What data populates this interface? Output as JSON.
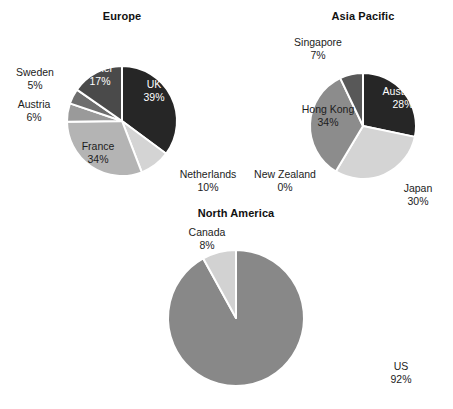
{
  "figure": {
    "background": "#ffffff",
    "separator_color": "#ffffff"
  },
  "chart_data": [
    {
      "type": "pie",
      "title": "Europe",
      "center": [
        122,
        121
      ],
      "radius": 55,
      "start_angle": 0,
      "direction": "clockwise",
      "labels": [
        "UK",
        "Netherlands",
        "France",
        "Austria",
        "Sweden",
        "Other"
      ],
      "values": [
        39,
        10,
        34,
        6,
        5,
        17
      ],
      "value_suffix": "%",
      "colors": [
        "#262626",
        "#d4d4d4",
        "#b4b4b4",
        "#9a9a9a",
        "#6e6e6e",
        "#4a4a4a"
      ],
      "label_text_colors": [
        "#ffffff",
        "#1c1c1c",
        "#1c1c1c",
        "#1c1c1c",
        "#1c1c1c",
        "#ffffff"
      ],
      "slice_label_texts": [
        {
          "name": "UK",
          "value": "39%"
        },
        {
          "name": "Netherlands",
          "value": "10%"
        },
        {
          "name": "France",
          "value": "34%"
        },
        {
          "name": "Austria",
          "value": "6%"
        },
        {
          "name": "Sweden",
          "value": "5%"
        },
        {
          "name": "Other",
          "value": "17%"
        }
      ]
    },
    {
      "type": "pie",
      "title": "Asia Pacific",
      "center": [
        363,
        126
      ],
      "radius": 53,
      "start_angle": 0,
      "direction": "clockwise",
      "labels": [
        "Australia",
        "Japan",
        "New Zealand",
        "Hong Kong",
        "Singapore"
      ],
      "values": [
        28,
        30,
        0,
        34,
        7
      ],
      "value_suffix": "%",
      "colors": [
        "#262626",
        "#d4d4d4",
        "#b0b0b0",
        "#8c8c8c",
        "#585858"
      ],
      "label_text_colors": [
        "#ffffff",
        "#1c1c1c",
        "#1c1c1c",
        "#1c1c1c",
        "#1c1c1c"
      ],
      "slice_label_texts": [
        {
          "name": "Australia",
          "value": "28%"
        },
        {
          "name": "Japan",
          "value": "30%"
        },
        {
          "name": "New Zealand",
          "value": "0%"
        },
        {
          "name": "Hong Kong",
          "value": "34%"
        },
        {
          "name": "Singapore",
          "value": "7%"
        }
      ]
    },
    {
      "type": "pie",
      "title": "North America",
      "center": [
        236,
        318
      ],
      "radius": 68,
      "start_angle": 0,
      "direction": "clockwise",
      "labels": [
        "US",
        "Canada"
      ],
      "values": [
        92,
        8
      ],
      "value_suffix": "%",
      "colors": [
        "#888888",
        "#d2d2d2"
      ],
      "label_text_colors": [
        "#1c1c1c",
        "#1c1c1c"
      ],
      "slice_label_texts": [
        {
          "name": "US",
          "value": "92%"
        },
        {
          "name": "Canada",
          "value": "8%"
        }
      ]
    }
  ],
  "europe": {
    "title": "Europe",
    "uk": {
      "name": "UK",
      "value": "39%"
    },
    "netherlands": {
      "name": "Netherlands",
      "value": "10%"
    },
    "france": {
      "name": "France",
      "value": "34%"
    },
    "austria": {
      "name": "Austria",
      "value": "6%"
    },
    "sweden": {
      "name": "Sweden",
      "value": "5%"
    },
    "other": {
      "name": "Other",
      "value": "17%"
    }
  },
  "asia_pacific": {
    "title": "Asia Pacific",
    "australia": {
      "name": "Australia",
      "value": "28%"
    },
    "japan": {
      "name": "Japan",
      "value": "30%"
    },
    "new_zealand": {
      "name": "New Zealand",
      "value": "0%"
    },
    "hong_kong": {
      "name": "Hong Kong",
      "value": "34%"
    },
    "singapore": {
      "name": "Singapore",
      "value": "7%"
    }
  },
  "north_america": {
    "title": "North America",
    "us": {
      "name": "US",
      "value": "92%"
    },
    "canada": {
      "name": "Canada",
      "value": "8%"
    }
  }
}
